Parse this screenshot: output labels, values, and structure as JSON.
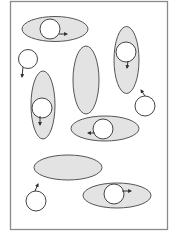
{
  "diagram": {
    "width": 177,
    "height": 237,
    "colors": {
      "background": "#ffffff",
      "frame_stroke": "#8a8a8a",
      "ellipse_fill": "#e3e3e3",
      "ellipse_stroke": "#555555",
      "circle_fill": "#ffffff",
      "circle_stroke": "#444444",
      "arrow": "#333333"
    },
    "frame": {
      "x": 10.5,
      "y": 1.5,
      "width": 157,
      "height": 228
    },
    "ellipses": [
      {
        "id": "top-horizontal",
        "cx": 55,
        "cy": 29,
        "rx": 33,
        "ry": 12.5
      },
      {
        "id": "left-vertical",
        "cx": 43,
        "cy": 105,
        "rx": 12,
        "ry": 34
      },
      {
        "id": "middle-vertical",
        "cx": 86,
        "cy": 80,
        "rx": 13,
        "ry": 34
      },
      {
        "id": "right-vertical",
        "cx": 126.5,
        "cy": 60,
        "rx": 12.5,
        "ry": 33.5
      },
      {
        "id": "middle-horizontal",
        "cx": 105,
        "cy": 128.5,
        "rx": 34,
        "ry": 12.5
      },
      {
        "id": "lower-left-horizontal",
        "cx": 68,
        "cy": 167.5,
        "rx": 34,
        "ry": 12.5
      },
      {
        "id": "bottom-right-horizontal",
        "cx": 117,
        "cy": 195.5,
        "rx": 34,
        "ry": 12.5
      }
    ],
    "circles": [
      {
        "id": "in-top-horizontal",
        "cx": 50,
        "cy": 29,
        "r": 10,
        "arrow": {
          "x1": 59,
          "y1": 34,
          "x2": 67,
          "y2": 34
        }
      },
      {
        "id": "free-left",
        "cx": 28,
        "cy": 59,
        "r": 9.5,
        "arrow": {
          "x1": 23,
          "y1": 67,
          "x2": 22,
          "y2": 77
        }
      },
      {
        "id": "in-left-vertical",
        "cx": 42,
        "cy": 108,
        "r": 10,
        "arrow": {
          "x1": 40,
          "y1": 116,
          "x2": 40,
          "y2": 125
        }
      },
      {
        "id": "in-right-vertical",
        "cx": 126,
        "cy": 52,
        "r": 10,
        "arrow": {
          "x1": 128,
          "y1": 61,
          "x2": 127,
          "y2": 68
        }
      },
      {
        "id": "free-right",
        "cx": 145,
        "cy": 106,
        "r": 10,
        "arrow": {
          "x1": 145,
          "y1": 96,
          "x2": 141,
          "y2": 90
        }
      },
      {
        "id": "in-middle-horizontal",
        "cx": 103,
        "cy": 129,
        "r": 10,
        "arrow": {
          "x1": 95,
          "y1": 133,
          "x2": 88,
          "y2": 133
        }
      },
      {
        "id": "free-bottom-left",
        "cx": 36,
        "cy": 201,
        "r": 10,
        "arrow": {
          "x1": 35,
          "y1": 191,
          "x2": 38,
          "y2": 184
        }
      },
      {
        "id": "in-bottom-right-horizontal",
        "cx": 114,
        "cy": 194,
        "r": 10,
        "arrow": {
          "x1": 122,
          "y1": 191,
          "x2": 131,
          "y2": 191
        }
      }
    ]
  }
}
